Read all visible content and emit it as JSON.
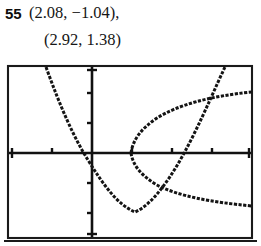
{
  "problem": {
    "number": "55",
    "solution_line_1": "(2.08, −1.04),",
    "solution_line_2": "(2.92, 1.38)"
  },
  "graph": {
    "label": "graphing-calculator-plot",
    "colors": {
      "ink": "#141414",
      "frame": "#1a1a1a",
      "background": "#ffffff"
    },
    "screen": {
      "x": 8,
      "y": 6,
      "width": 244,
      "height": 172
    },
    "axes": {
      "x_axis_y": 93,
      "y_axis_x": 92,
      "x_tick_spacing": 40,
      "y_tick_spacing": 30,
      "x_ticks": [
        52,
        132,
        172,
        212
      ],
      "y_ticks": [
        33,
        63,
        123,
        153
      ]
    },
    "curves": [
      {
        "name": "upward-parabola",
        "type": "parabola-opens-up",
        "vertex": [
          135,
          152
        ],
        "path": "M 46,7 C 60,46 74,78 88,100 C 104,126 118,145 135,152 C 152,145 172,118 192,78 C 206,50 216,26 225,7"
      },
      {
        "name": "sideways-parabola-upper-branch",
        "type": "parabola-opens-right-upper",
        "vertex": [
          131,
          93
        ],
        "path": "M 131,93 C 133,79 142,68 157,58 C 178,45 210,36 252,32"
      },
      {
        "name": "sideways-parabola-lower-branch",
        "type": "parabola-opens-right-lower",
        "vertex": [
          131,
          93
        ],
        "path": "M 131,93 C 133,106 142,116 157,125 C 178,136 210,142 252,146"
      }
    ]
  },
  "solutions": {
    "intersection_1": {
      "x": 2.08,
      "y": -1.04
    },
    "intersection_2": {
      "x": 2.92,
      "y": 1.38
    }
  }
}
